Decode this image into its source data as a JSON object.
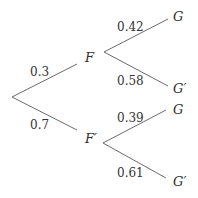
{
  "diagram": {
    "type": "probability-tree",
    "first_stage": {
      "upper": {
        "node": "F",
        "prob": "0.3"
      },
      "lower": {
        "node": "F′",
        "prob": "0.7"
      }
    },
    "second_stage": {
      "from_F": {
        "upper": {
          "node": "G",
          "prob": "0.42"
        },
        "lower": {
          "node": "G′",
          "prob": "0.58"
        }
      },
      "from_F_prime": {
        "upper": {
          "node": "G",
          "prob": "0.39"
        },
        "lower": {
          "node": "G′",
          "prob": "0.61"
        }
      }
    },
    "colors": {
      "line": "#6b6b6b",
      "text": "#333333"
    }
  }
}
